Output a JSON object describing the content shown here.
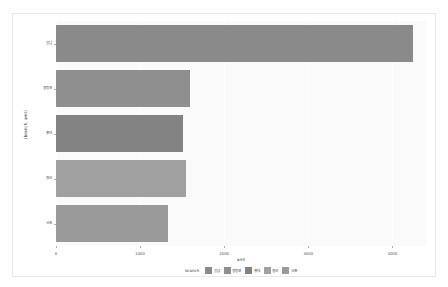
{
  "chart_data": {
    "type": "bar",
    "orientation": "horizontal",
    "title": "",
    "xlabel": "amt",
    "ylabel": "(branch, amt)",
    "categories": [
      "강남",
      "영등포",
      "홍대",
      "용산",
      "서초"
    ],
    "values": [
      4250,
      1590,
      1510,
      1545,
      1335
    ],
    "xlim": [
      0,
      4400
    ],
    "xticks": [
      0,
      1000,
      2000,
      3000,
      4000
    ],
    "xticklabels": [
      "0",
      "1000",
      "2000",
      "3000",
      "4000"
    ],
    "grid": true,
    "legend": {
      "title": "branch",
      "position": "bottom",
      "entries": [
        {
          "label": "강남",
          "color": "#8a8a8a"
        },
        {
          "label": "영등포",
          "color": "#8f8f8f"
        },
        {
          "label": "홍대",
          "color": "#828282"
        },
        {
          "label": "용산",
          "color": "#a0a0a0"
        },
        {
          "label": "서초",
          "color": "#9a9a9a"
        }
      ]
    },
    "series": [
      {
        "name": "강남",
        "value": 4250,
        "color": "#8a8a8a"
      },
      {
        "name": "영등포",
        "value": 1590,
        "color": "#8f8f8f"
      },
      {
        "name": "홍대",
        "value": 1510,
        "color": "#828282"
      },
      {
        "name": "용산",
        "value": 1545,
        "color": "#a0a0a0"
      },
      {
        "name": "서초",
        "value": 1335,
        "color": "#9a9a9a"
      }
    ]
  },
  "panel": {
    "background": "#fafafa",
    "gridline_color": "#ffffff"
  }
}
